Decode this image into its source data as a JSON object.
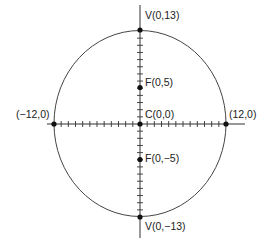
{
  "diagram": {
    "type": "ellipse",
    "equation_implied": "x^2/144 + y^2/169 = 1",
    "center": {
      "x": 0,
      "y": 0,
      "label": "C(0,0)"
    },
    "semi_axes": {
      "horizontal": 12,
      "vertical": 13
    },
    "tick_spacing": 1,
    "points": [
      {
        "id": "v_top",
        "x": 0,
        "y": 13,
        "label": "V(0,13)"
      },
      {
        "id": "f_top",
        "x": 0,
        "y": 5,
        "label": "F(0,5)"
      },
      {
        "id": "center",
        "x": 0,
        "y": 0,
        "label": "C(0,0)"
      },
      {
        "id": "f_bottom",
        "x": 0,
        "y": -5,
        "label": "F(0,−5)"
      },
      {
        "id": "v_bottom",
        "x": 0,
        "y": -13,
        "label": "V(0,−13)"
      },
      {
        "id": "left",
        "x": -12,
        "y": 0,
        "label": "(−12,0)"
      },
      {
        "id": "right",
        "x": 12,
        "y": 0,
        "label": "(12,0)"
      }
    ],
    "colors": {
      "stroke": "#444444",
      "point": "#111111",
      "text": "#222222",
      "background": "#ffffff"
    }
  },
  "labels": {
    "v_top": "V(0,13)",
    "f_top": "F(0,5)",
    "center": "C(0,0)",
    "f_bottom": "F(0,−5)",
    "v_bottom": "V(0,−13)",
    "left": "(−12,0)",
    "right": "(12,0)"
  }
}
